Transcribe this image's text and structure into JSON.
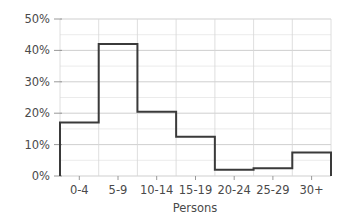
{
  "chart_data": {
    "type": "bar",
    "title": "",
    "xlabel": "Persons",
    "ylabel": "",
    "categories": [
      "0-4",
      "5-9",
      "10-14",
      "15-19",
      "20-24",
      "25-29",
      "30+"
    ],
    "values": [
      17,
      42,
      20.5,
      12.5,
      2,
      2.5,
      7.5
    ],
    "value_unit": "%",
    "ylim": [
      0,
      50
    ],
    "xlim": [
      0,
      7
    ],
    "ytick_labels": [
      "0%",
      "10%",
      "20%",
      "30%",
      "40%",
      "50%"
    ],
    "ytick_values": [
      0,
      10,
      20,
      30,
      40,
      50
    ],
    "yminor_values": [
      5,
      15,
      25,
      35,
      45
    ],
    "grid": true,
    "legend": null,
    "style": "step-histogram-outline",
    "line_color": "#3a3a3a",
    "grid_color": "#c9c9c9",
    "minor_grid_color": "#e2e2e2",
    "text_color": "#4a4a4a",
    "background_color": "#ffffff"
  },
  "axes": {
    "y_axis_name": "percent-axis",
    "x_axis_name": "persons-axis"
  }
}
